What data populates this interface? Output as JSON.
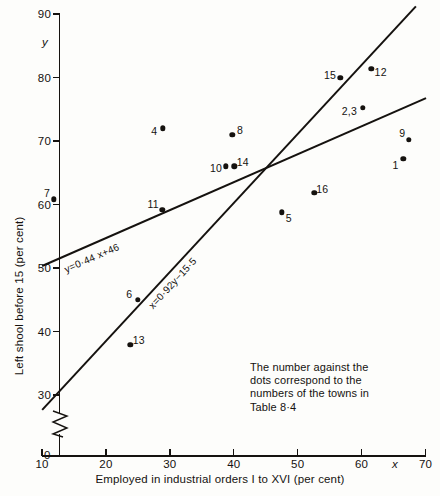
{
  "chart_data": {
    "type": "scatter",
    "title": "",
    "xlabel": "Employed in industrial orders I to XVI (per cent)",
    "ylabel": "Left shool before 15 (per cent)",
    "x_symbol": "x",
    "y_symbol": "y",
    "xlim": [
      10,
      70
    ],
    "ylim": [
      30,
      90
    ],
    "x_ticks": [
      10,
      20,
      30,
      40,
      50,
      60,
      70
    ],
    "y_ticks": [
      30,
      40,
      50,
      60,
      70,
      80,
      90
    ],
    "y_axis_break": true,
    "y_origin_label": "0",
    "grid": false,
    "legend": "none",
    "points": [
      {
        "label": "7",
        "x": 11.8,
        "y": 60.8,
        "lx": -6.5,
        "ly": -6.5
      },
      {
        "label": "4",
        "x": 28.9,
        "y": 72.0,
        "lx": -8.5,
        "ly": 2.5
      },
      {
        "label": "11",
        "x": 28.8,
        "y": 59.2,
        "lx": -9.0,
        "ly": -5.5
      },
      {
        "label": "13",
        "x": 23.8,
        "y": 37.9,
        "lx": 8.5,
        "ly": -4.5
      },
      {
        "label": "6",
        "x": 25.0,
        "y": 45.0,
        "lx": -8.5,
        "ly": -5.5
      },
      {
        "label": "8",
        "x": 39.8,
        "y": 71.0,
        "lx": 7.5,
        "ly": -5.0
      },
      {
        "label": "10",
        "x": 38.8,
        "y": 66.0,
        "lx": -10.0,
        "ly": 2.0
      },
      {
        "label": "14",
        "x": 40.1,
        "y": 66.0,
        "lx": 8.5,
        "ly": -4.5
      },
      {
        "label": "5",
        "x": 47.5,
        "y": 58.8,
        "lx": 7.0,
        "ly": 5.5
      },
      {
        "label": "16",
        "x": 52.6,
        "y": 61.8,
        "lx": 8.0,
        "ly": -4.5
      },
      {
        "label": "15",
        "x": 56.7,
        "y": 80.0,
        "lx": -10.5,
        "ly": -3.0
      },
      {
        "label": "12",
        "x": 61.5,
        "y": 81.4,
        "lx": 9.5,
        "ly": 3.5
      },
      {
        "label": "2,3",
        "x": 60.2,
        "y": 75.2,
        "lx": -13.5,
        "ly": 3.5
      },
      {
        "label": "9",
        "x": 67.4,
        "y": 70.2,
        "lx": -6.5,
        "ly": -6.5
      },
      {
        "label": "1",
        "x": 66.5,
        "y": 67.2,
        "lx": -7.5,
        "ly": 6.0
      }
    ],
    "lines": [
      {
        "name": "regression-y-on-x",
        "equation": "y=0·44 x+46",
        "slope": 0.44,
        "intercept": 46,
        "x_start": 10.0,
        "x_end": 70.0
      },
      {
        "name": "regression-x-on-y",
        "equation": "x=0·92y−15·5",
        "slope": 0.92,
        "intercept": -15.5,
        "x_start": 10.0,
        "x_end": 68.5
      }
    ],
    "annotation": "The number against the\ndots correspond to the\nnumbers of the towns in\nTable 8·4"
  }
}
